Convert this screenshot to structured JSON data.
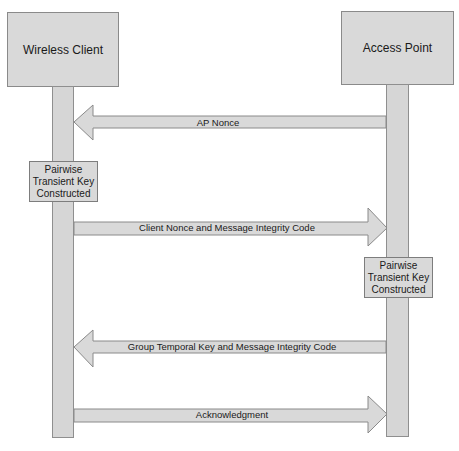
{
  "participants": [
    {
      "id": "client",
      "label": "Wireless Client"
    },
    {
      "id": "ap",
      "label": "Access Point"
    }
  ],
  "notes": [
    {
      "on": "client",
      "lines": [
        "Pairwise",
        "Transient Key",
        "Constructed"
      ]
    },
    {
      "on": "ap",
      "lines": [
        "Pairwise",
        "Transient Key",
        "Constructed"
      ]
    }
  ],
  "messages": [
    {
      "from": "ap",
      "to": "client",
      "label": "AP Nonce"
    },
    {
      "from": "client",
      "to": "ap",
      "label": "Client Nonce and Message Integrity Code"
    },
    {
      "from": "ap",
      "to": "client",
      "label": "Group Temporal Key and Message Integrity Code"
    },
    {
      "from": "client",
      "to": "ap",
      "label": "Acknowledgment"
    }
  ],
  "colors": {
    "fill": "#d9d9d9",
    "stroke": "#8a8a8a",
    "text": "#1a1a1a",
    "background": "#ffffff"
  }
}
